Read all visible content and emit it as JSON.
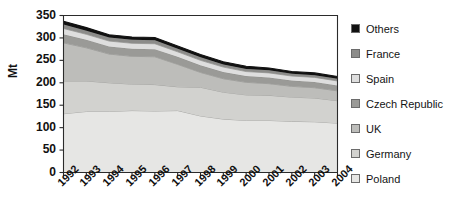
{
  "chart_data": {
    "type": "area",
    "title": "",
    "subtitle": "",
    "xlabel": "",
    "ylabel": "Mt",
    "categories": [
      "1992",
      "1993",
      "1994",
      "1995",
      "1996",
      "1997",
      "1998",
      "1999",
      "2000",
      "2001",
      "2002",
      "2003",
      "2004"
    ],
    "x": [
      1992,
      1993,
      1994,
      1995,
      1996,
      1997,
      1998,
      1999,
      2000,
      2001,
      2002,
      2003,
      2004
    ],
    "ylim": [
      0,
      350
    ],
    "yticks": [
      0,
      50,
      100,
      150,
      200,
      250,
      300,
      350
    ],
    "grid": false,
    "stacked": true,
    "legend_position": "right",
    "series": [
      {
        "name": "Poland",
        "color": "#e6e6e4",
        "values": [
          131,
          136,
          136,
          138,
          137,
          138,
          126,
          119,
          116,
          116,
          114,
          113,
          110
        ]
      },
      {
        "name": "Germany",
        "color": "#d2d2cf",
        "values": [
          73,
          68,
          64,
          59,
          59,
          53,
          64,
          60,
          57,
          56,
          54,
          53,
          50
        ]
      },
      {
        "name": "UK",
        "color": "#bdbdba",
        "values": [
          85,
          74,
          64,
          62,
          62,
          50,
          33,
          30,
          28,
          26,
          24,
          23,
          22
        ]
      },
      {
        "name": "Czech Republic",
        "color": "#9a9a97",
        "values": [
          19,
          18,
          17,
          17,
          17,
          17,
          16,
          15,
          14,
          14,
          13,
          13,
          12
        ]
      },
      {
        "name": "Spain",
        "color": "#dedede",
        "values": [
          13,
          12,
          12,
          12,
          12,
          11,
          11,
          11,
          10,
          10,
          10,
          10,
          10
        ]
      },
      {
        "name": "France",
        "color": "#8c8c8a",
        "values": [
          9,
          8,
          8,
          8,
          8,
          7,
          7,
          6,
          6,
          6,
          5,
          5,
          5
        ]
      },
      {
        "name": "Others",
        "color": "#111111",
        "values": [
          7,
          7,
          6,
          6,
          6,
          6,
          6,
          6,
          6,
          5,
          5,
          5,
          5
        ]
      }
    ],
    "totals": [
      337,
      323,
      307,
      302,
      301,
      282,
      263,
      247,
      237,
      233,
      225,
      222,
      214
    ]
  },
  "axis": {
    "ylabel": "Mt",
    "ytick_labels": [
      "350",
      "300",
      "250",
      "200",
      "150",
      "100",
      "50",
      "0"
    ],
    "xtick_labels": [
      "1992",
      "1993",
      "1994",
      "1995",
      "1996",
      "1997",
      "1998",
      "1999",
      "2000",
      "2001",
      "2002",
      "2003",
      "2004"
    ]
  },
  "legend": {
    "items": [
      {
        "label": "Others",
        "color": "#111111"
      },
      {
        "label": "France",
        "color": "#8c8c8a"
      },
      {
        "label": "Spain",
        "color": "#dedede"
      },
      {
        "label": "Czech Republic",
        "color": "#9a9a97"
      },
      {
        "label": "UK",
        "color": "#bdbdba"
      },
      {
        "label": "Germany",
        "color": "#d2d2cf"
      },
      {
        "label": "Poland",
        "color": "#e6e6e4"
      }
    ]
  }
}
